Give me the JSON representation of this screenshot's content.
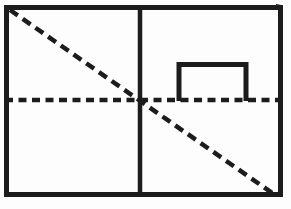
{
  "canvas": {
    "width": 291,
    "height": 209,
    "background_color": "#fdfdfd",
    "stroke_color": "#1c1c1c"
  },
  "figure": {
    "outer_rect": {
      "name": "outer-rectangle",
      "x": 6.5,
      "y": 7.5,
      "width": 274,
      "height": 187,
      "stroke_width": 5,
      "dash": ""
    },
    "lines": [
      {
        "name": "vertical-divider-line",
        "x1": 140,
        "y1": 8,
        "x2": 140,
        "y2": 194,
        "stroke_width": 4.5,
        "dash": ""
      },
      {
        "name": "horizontal-dashed-midline",
        "x1": 5,
        "y1": 100,
        "x2": 283,
        "y2": 100,
        "stroke_width": 4.5,
        "dash": "8 5.5"
      },
      {
        "name": "diagonal-dashed-line",
        "x1": 10,
        "y1": 10,
        "x2": 275,
        "y2": 195,
        "stroke_width": 4.5,
        "dash": "9.5 6"
      }
    ],
    "staple_shape": {
      "name": "open-staple-shape",
      "points": "179,101 179,64.5 246,64.5 246,101",
      "stroke_width": 5,
      "dash": ""
    },
    "corner_tick": {
      "name": "top-right-corner-tick",
      "x1": 276,
      "y1": 5,
      "x2": 281,
      "y2": 6,
      "stroke_width": 2,
      "dash": ""
    }
  }
}
